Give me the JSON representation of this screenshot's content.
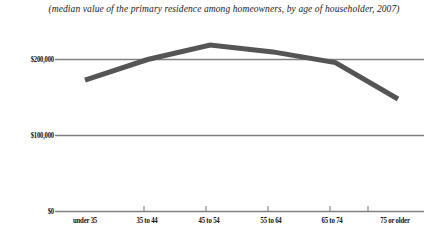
{
  "caption": "(median value of the primary residence among homeowners, by age of householder, 2007)",
  "axis": {
    "y_ticks": [
      "$200,000",
      "$100,000",
      "$0"
    ],
    "x_ticks": [
      "under 35",
      "35 to 44",
      "45 to 54",
      "55 to 64",
      "65 to 74",
      "75 or older"
    ]
  },
  "colors": {
    "line": "#555555",
    "gridline": "#808080",
    "text": "#111111"
  },
  "chart_data": {
    "type": "line",
    "title": "(median value of the primary residence among homeowners, by age of householder, 2007)",
    "xlabel": "",
    "ylabel": "",
    "categories": [
      "under 35",
      "35 to 44",
      "45 to 54",
      "55 to 64",
      "65 to 74",
      "75 or older"
    ],
    "values": [
      173000,
      200000,
      219000,
      210000,
      196000,
      148000
    ],
    "series": [
      {
        "name": "median home value",
        "values": [
          173000,
          200000,
          219000,
          210000,
          196000,
          148000
        ]
      }
    ],
    "ylim": [
      0,
      263000
    ],
    "ytick_values": [
      200000,
      100000,
      0
    ],
    "grid": true,
    "legend": "none"
  }
}
